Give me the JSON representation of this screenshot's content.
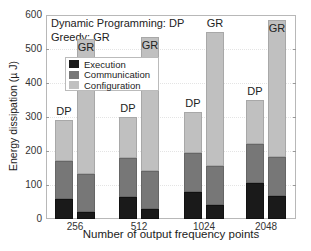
{
  "chart_data": {
    "type": "bar",
    "stacked": true,
    "grouped": true,
    "title": "",
    "xlabel": "Number of output frequency points",
    "ylabel": "Energy dissipation (µ J)",
    "ylim": [
      0,
      600
    ],
    "yticks": [
      0,
      100,
      200,
      300,
      400,
      500,
      600
    ],
    "grid": true,
    "categories": [
      "256",
      "512",
      "1024",
      "2048"
    ],
    "groups": [
      "DP",
      "GR"
    ],
    "annotation": [
      "Dynamic Programming: DP",
      "Greedy: GR"
    ],
    "legend": {
      "position": "upper-left",
      "entries": [
        {
          "name": "Execution",
          "color": "#1a1a1a"
        },
        {
          "name": "Communication",
          "color": "#777777"
        },
        {
          "name": "Configuration",
          "color": "#c0c0c0"
        }
      ]
    },
    "series": [
      {
        "name": "Execution",
        "DP": [
          58,
          65,
          80,
          105
        ],
        "GR": [
          20,
          28,
          40,
          68
        ]
      },
      {
        "name": "Communication",
        "DP": [
          114,
          115,
          115,
          115
        ],
        "GR": [
          113,
          114,
          115,
          114
        ]
      },
      {
        "name": "Configuration",
        "DP": [
          118,
          120,
          120,
          130
        ],
        "GR": [
          397,
          394,
          395,
          403
        ]
      }
    ],
    "totals": {
      "DP": [
        290,
        300,
        315,
        350
      ],
      "GR": [
        530,
        536,
        550,
        585
      ]
    }
  }
}
